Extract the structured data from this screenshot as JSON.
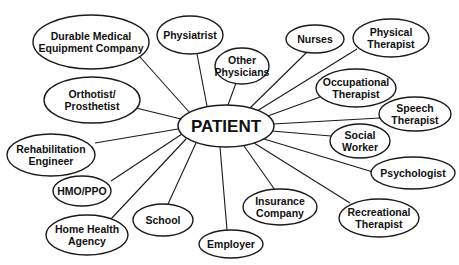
{
  "diagram": {
    "type": "hub-and-spoke",
    "center": {
      "id": "patient",
      "label": "PATIENT",
      "cx": 226,
      "cy": 126,
      "rx": 48,
      "ry": 21,
      "font_size": 17
    },
    "nodes": [
      {
        "id": "durable-medical-equipment-company",
        "lines": [
          "Durable Medical",
          "Equipment Company"
        ],
        "cx": 91,
        "cy": 42,
        "rx": 58,
        "ry": 27,
        "font_size": 10.5
      },
      {
        "id": "physiatrist",
        "lines": [
          "Physiatrist"
        ],
        "cx": 190,
        "cy": 35,
        "rx": 33,
        "ry": 19,
        "font_size": 10.5
      },
      {
        "id": "other-physicians",
        "lines": [
          "Other",
          "Physicians"
        ],
        "cx": 242,
        "cy": 66,
        "rx": 27,
        "ry": 18,
        "font_size": 10.5
      },
      {
        "id": "nurses",
        "lines": [
          "Nurses"
        ],
        "cx": 315,
        "cy": 39,
        "rx": 29,
        "ry": 14,
        "font_size": 10.5
      },
      {
        "id": "physical-therapist",
        "lines": [
          "Physical",
          "Therapist"
        ],
        "cx": 391,
        "cy": 38,
        "rx": 38,
        "ry": 19,
        "font_size": 10.5
      },
      {
        "id": "occupational-therapist",
        "lines": [
          "Occupational",
          "Therapist"
        ],
        "cx": 356,
        "cy": 88,
        "rx": 40,
        "ry": 19,
        "font_size": 10.5
      },
      {
        "id": "speech-therapist",
        "lines": [
          "Speech",
          "Therapist"
        ],
        "cx": 415,
        "cy": 114,
        "rx": 36,
        "ry": 17,
        "font_size": 10.5
      },
      {
        "id": "social-worker",
        "lines": [
          "Social",
          "Worker"
        ],
        "cx": 360,
        "cy": 141,
        "rx": 30,
        "ry": 17,
        "font_size": 10.5
      },
      {
        "id": "psychologist",
        "lines": [
          "Psychologist"
        ],
        "cx": 413,
        "cy": 173,
        "rx": 42,
        "ry": 16,
        "font_size": 10.5
      },
      {
        "id": "recreational-therapist",
        "lines": [
          "Recreational",
          "Therapist"
        ],
        "cx": 379,
        "cy": 218,
        "rx": 40,
        "ry": 19,
        "font_size": 10.5
      },
      {
        "id": "insurance-company",
        "lines": [
          "Insurance",
          "Company"
        ],
        "cx": 280,
        "cy": 207,
        "rx": 37,
        "ry": 18,
        "font_size": 10.5
      },
      {
        "id": "employer",
        "lines": [
          "Employer"
        ],
        "cx": 231,
        "cy": 244,
        "rx": 32,
        "ry": 14,
        "font_size": 10.5
      },
      {
        "id": "school",
        "lines": [
          "School"
        ],
        "cx": 163,
        "cy": 220,
        "rx": 30,
        "ry": 16,
        "font_size": 10.5
      },
      {
        "id": "home-health-agency",
        "lines": [
          "Home Health",
          "Agency"
        ],
        "cx": 87,
        "cy": 235,
        "rx": 41,
        "ry": 20,
        "font_size": 10.5
      },
      {
        "id": "hmo-ppo",
        "lines": [
          "HMO/PPO"
        ],
        "cx": 82,
        "cy": 191,
        "rx": 29,
        "ry": 15,
        "font_size": 10.5
      },
      {
        "id": "rehabilitation-engineer",
        "lines": [
          "Rehabilitation",
          "Engineer"
        ],
        "cx": 51,
        "cy": 155,
        "rx": 44,
        "ry": 21,
        "font_size": 10.5
      },
      {
        "id": "orthotist-prosthetist",
        "lines": [
          "Orthotist/",
          "Prosthetist"
        ],
        "cx": 92,
        "cy": 100,
        "rx": 48,
        "ry": 23,
        "font_size": 10.5
      }
    ],
    "edges": [
      {
        "from": "patient",
        "to": "durable-medical-equipment-company",
        "x1": 190,
        "y1": 113,
        "x2": 140,
        "y2": 57
      },
      {
        "from": "patient",
        "to": "physiatrist",
        "x1": 207,
        "y1": 106,
        "x2": 197,
        "y2": 54
      },
      {
        "from": "patient",
        "to": "other-physicians",
        "x1": 228,
        "y1": 105,
        "x2": 236,
        "y2": 83
      },
      {
        "from": "patient",
        "to": "nurses",
        "x1": 250,
        "y1": 108,
        "x2": 307,
        "y2": 52
      },
      {
        "from": "patient",
        "to": "physical-therapist",
        "x1": 257,
        "y1": 111,
        "x2": 357,
        "y2": 49
      },
      {
        "from": "patient",
        "to": "occupational-therapist",
        "x1": 265,
        "y1": 117,
        "x2": 320,
        "y2": 97
      },
      {
        "from": "patient",
        "to": "speech-therapist",
        "x1": 273,
        "y1": 124,
        "x2": 380,
        "y2": 118
      },
      {
        "from": "patient",
        "to": "social-worker",
        "x1": 272,
        "y1": 131,
        "x2": 331,
        "y2": 136
      },
      {
        "from": "patient",
        "to": "psychologist",
        "x1": 264,
        "y1": 139,
        "x2": 373,
        "y2": 172
      },
      {
        "from": "patient",
        "to": "recreational-therapist",
        "x1": 254,
        "y1": 143,
        "x2": 350,
        "y2": 203
      },
      {
        "from": "patient",
        "to": "insurance-company",
        "x1": 244,
        "y1": 146,
        "x2": 275,
        "y2": 190
      },
      {
        "from": "patient",
        "to": "employer",
        "x1": 220,
        "y1": 147,
        "x2": 227,
        "y2": 230
      },
      {
        "from": "patient",
        "to": "school",
        "x1": 196,
        "y1": 143,
        "x2": 168,
        "y2": 204
      },
      {
        "from": "patient",
        "to": "home-health-agency",
        "x1": 186,
        "y1": 139,
        "x2": 111,
        "y2": 219
      },
      {
        "from": "patient",
        "to": "hmo-ppo",
        "x1": 182,
        "y1": 134,
        "x2": 111,
        "y2": 181
      },
      {
        "from": "patient",
        "to": "rehabilitation-engineer",
        "x1": 178,
        "y1": 129,
        "x2": 95,
        "y2": 143
      },
      {
        "from": "patient",
        "to": "orthotist-prosthetist",
        "x1": 181,
        "y1": 119,
        "x2": 136,
        "y2": 108
      }
    ],
    "colors": {
      "stroke": "#1a1a1a",
      "fill": "#ffffff",
      "text": "#111111",
      "background": "#ffffff"
    }
  }
}
